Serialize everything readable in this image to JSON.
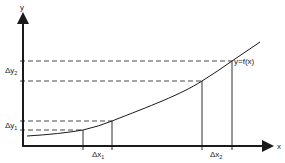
{
  "diagram": {
    "axes": {
      "x_label": "x",
      "y_label": "y"
    },
    "curve": {
      "label": "y = f(x)",
      "label_text": "y=f(x)",
      "points": [
        [
          27,
          136
        ],
        [
          83,
          130
        ],
        [
          112,
          121
        ],
        [
          160,
          100
        ],
        [
          202,
          81
        ],
        [
          232,
          61
        ],
        [
          260,
          42
        ]
      ]
    },
    "intervals": {
      "dx1": {
        "symbol": "Δx",
        "subscript": "1"
      },
      "dx2": {
        "symbol": "Δx",
        "subscript": "2"
      },
      "dy1": {
        "symbol": "Δy",
        "subscript": "1"
      },
      "dy2": {
        "symbol": "Δy",
        "subscript": "2"
      }
    },
    "colors": {
      "stroke": "#1a1a1a",
      "background": "#ffffff"
    }
  }
}
